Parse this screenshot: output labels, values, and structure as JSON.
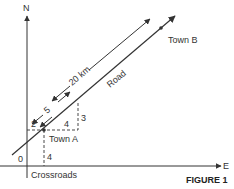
{
  "figure": {
    "caption": "FIGURE 1",
    "axes": {
      "north_label": "N",
      "east_label": "E",
      "origin_label": "0"
    },
    "places": {
      "town_a": "Town A",
      "town_b": "Town B",
      "crossroads": "Crossroads"
    },
    "road_label": "Road",
    "distances": {
      "total": "20 km",
      "segment": "5",
      "town_a_north": "4",
      "town_a_east_offset": "2",
      "triangle_run": "4",
      "triangle_rise": "3"
    },
    "colors": {
      "ink": "#333333",
      "background": "#ffffff"
    }
  }
}
